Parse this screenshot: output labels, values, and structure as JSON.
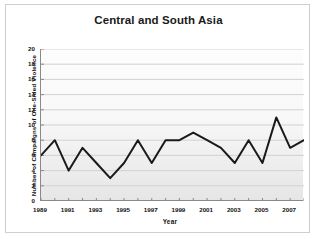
{
  "chart_data": {
    "type": "line",
    "title": "Central and South Asia",
    "xlabel": "Year",
    "ylabel": "Number of Campaigns of One-Sided Violence",
    "x": [
      1989,
      1990,
      1991,
      1992,
      1993,
      1994,
      1995,
      1996,
      1997,
      1998,
      1999,
      2000,
      2001,
      2002,
      2003,
      2004,
      2005,
      2006,
      2007,
      2008
    ],
    "values": [
      6,
      8,
      4,
      7,
      5,
      3,
      5,
      8,
      5,
      8,
      8,
      9,
      8,
      7,
      5,
      8,
      5,
      11,
      7,
      8
    ],
    "series": [
      {
        "name": "Number of Campaigns of One-Sided Violence",
        "values": [
          6,
          8,
          4,
          7,
          5,
          3,
          5,
          8,
          5,
          8,
          8,
          9,
          8,
          7,
          5,
          8,
          5,
          11,
          7,
          8
        ]
      }
    ],
    "xlim": [
      1989,
      2008
    ],
    "ylim": [
      0,
      20
    ],
    "ytick_labels": [
      "0",
      "2",
      "4",
      "6",
      "8",
      "10",
      "12",
      "14",
      "16",
      "18",
      "20"
    ],
    "ytick_values": [
      0,
      2,
      4,
      6,
      8,
      10,
      12,
      14,
      16,
      18,
      20
    ],
    "xtick_labels": [
      "1989",
      "1991",
      "1993",
      "1995",
      "1997",
      "1999",
      "2001",
      "2003",
      "2005",
      "2007"
    ],
    "xtick_values": [
      1989,
      1991,
      1993,
      1995,
      1997,
      1999,
      2001,
      2003,
      2005,
      2007
    ],
    "grid": "horizontal",
    "legend": "none",
    "line_color": "#1a1a1a",
    "grid_color": "#d2d2d2",
    "axis_color": "#8a8a8a",
    "plot_background": "#f2f2f2"
  }
}
